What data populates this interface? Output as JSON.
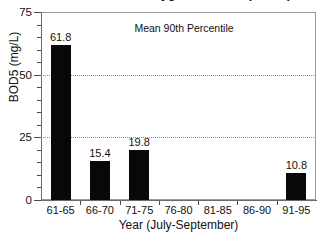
{
  "chart_data": {
    "type": "bar",
    "title": "Biochemical Oxygen Demand (BOD5)",
    "subtitle": "",
    "xlabel": "Year (July-September)",
    "ylabel": "BOD5 (mg/L)",
    "categories": [
      "61-65",
      "66-70",
      "71-75",
      "76-80",
      "81-85",
      "86-90",
      "91-95"
    ],
    "values": [
      61.8,
      15.4,
      19.8,
      null,
      null,
      null,
      10.8
    ],
    "value_labels": [
      "61.8",
      "15.4",
      "19.8",
      "",
      "",
      "",
      "10.8"
    ],
    "ylim": [
      0,
      75
    ],
    "yticks": [
      0,
      25,
      50,
      75
    ],
    "ytick_labels": [
      "0",
      "25",
      "50",
      "75"
    ],
    "yminor_step": 5,
    "gridlines": [
      25,
      50
    ],
    "grid": true,
    "grid_style": "dotted",
    "legend": "none",
    "bar_color": "#080808",
    "annotations": [
      {
        "text": "Mean 90th Percentile",
        "x_frac": 0.52,
        "y_value": 68.5
      }
    ]
  }
}
